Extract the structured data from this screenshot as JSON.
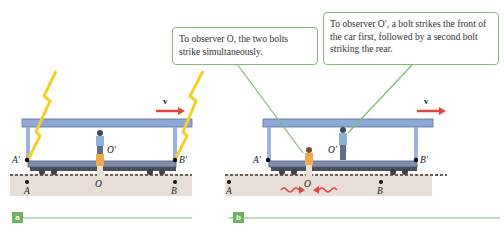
{
  "panels": [
    {
      "tag": "a",
      "labels": {
        "A_prime": "A′",
        "B_prime": "B′",
        "O_prime": "O′",
        "O": "O",
        "A": "A",
        "B": "B",
        "velocity": "v⃗"
      }
    },
    {
      "tag": "b",
      "labels": {
        "A_prime": "A′",
        "B_prime": "B′",
        "O_prime": "O′",
        "O": "O",
        "A": "A",
        "B": "B",
        "velocity": "v⃗"
      },
      "callouts": [
        {
          "text": "To observer O, the two bolts strike simultaneously."
        },
        {
          "text": "To observer O′, a bolt strikes the front of the car first, followed by a second bolt striking the rear."
        }
      ]
    }
  ],
  "colors": {
    "car": "#8fa8d8",
    "car_dark": "#5d6f95",
    "ground": "#d8cfc6",
    "bolt": "#f5cf2a",
    "arrow": "#e0473a",
    "accent": "#6fb35c"
  }
}
